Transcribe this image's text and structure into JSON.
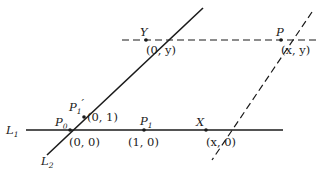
{
  "diagram": {
    "lines": {
      "L1": {
        "label": "L",
        "sub": "1",
        "style": "solid",
        "from": [
          26,
          130
        ],
        "to": [
          283,
          130
        ]
      },
      "L2": {
        "label": "L",
        "sub": "2",
        "style": "solid",
        "from": [
          47,
          155
        ],
        "to": [
          203,
          8
        ]
      },
      "y_line": {
        "style": "dashed",
        "from": [
          122,
          40
        ],
        "to": [
          318,
          40
        ]
      },
      "x_line": {
        "style": "dashed",
        "from": [
          312,
          12
        ],
        "to": [
          212,
          160
        ]
      }
    },
    "points": [
      {
        "id": "P0",
        "name": "P",
        "sub": "0",
        "coord": "(0, 0)",
        "x": 70,
        "y": 130
      },
      {
        "id": "P1",
        "name": "P",
        "sub": "1",
        "coord": "(1, 0)",
        "x": 144,
        "y": 130
      },
      {
        "id": "P1prime",
        "name": "P",
        "sub": "1",
        "prime": "′",
        "coord": "(0, 1)",
        "x": 84,
        "y": 117
      },
      {
        "id": "Y",
        "name": "Y",
        "coord": "(0, y)",
        "x": 146,
        "y": 40
      },
      {
        "id": "P",
        "name": "P",
        "coord": "(x, y)",
        "x": 281,
        "y": 40
      },
      {
        "id": "X",
        "name": "X",
        "coord": "(x, 0)",
        "x": 206,
        "y": 130
      }
    ],
    "colors": {
      "ink": "#1a1a1a",
      "background": "#ffffff"
    }
  }
}
